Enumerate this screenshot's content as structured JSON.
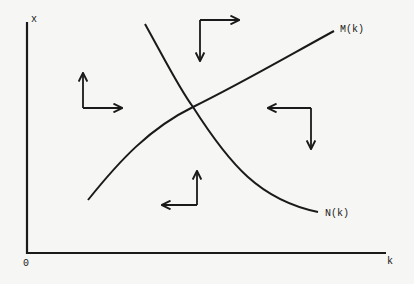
{
  "diagram": {
    "type": "phase-diagram",
    "axes": {
      "y_label": "x",
      "x_label": "k",
      "origin_label": "0"
    },
    "curves": [
      {
        "id": "M",
        "label": "M(k)",
        "shape": "increasing concave"
      },
      {
        "id": "N",
        "label": "N(k)",
        "shape": "decreasing convex"
      }
    ],
    "direction_arrows": [
      {
        "region": "left (below N, above M)",
        "horizontal": "right",
        "vertical": "up"
      },
      {
        "region": "top (above N and M)",
        "horizontal": "right",
        "vertical": "down"
      },
      {
        "region": "right (above N, below M)",
        "horizontal": "left",
        "vertical": "down"
      },
      {
        "region": "bottom (below N and M)",
        "horizontal": "left",
        "vertical": "up"
      }
    ],
    "colors": {
      "background": "#f6f6f4",
      "ink": "#1a1a1a"
    }
  }
}
